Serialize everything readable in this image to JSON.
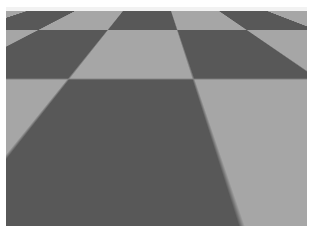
{
  "image": {
    "title": "Reflective sphere on checkerboard plane",
    "kind": "3d-render",
    "width_px": 313,
    "height_px": 233,
    "border": {
      "name": "white-paper-margin",
      "color": "#ffffff",
      "top_px": 7,
      "left_px": 6,
      "right_px": 6,
      "bottom_px": 7
    }
  },
  "scene": {
    "description": "A raytraced grey metallic sphere resting on an infinite black-and-white checkerboard floor, lit by a single bright light producing a sharp specular highlight and a dark elliptical cast shadow to the right.",
    "horizon": {
      "name": "horizon-line",
      "y_px": 11,
      "sky_color": "#f2f2f2"
    },
    "ground": {
      "name": "checkerboard-ground-plane",
      "light_square_color": "#a6a6a6",
      "dark_square_color": "#585858",
      "pattern": "checkerboard",
      "projection": "perspective"
    },
    "sphere": {
      "name": "reflective-sphere",
      "material": "polished pitted metal",
      "base_color": "#757575",
      "center_x_px": 147,
      "center_y_px": 103,
      "radius_x_px": 66,
      "radius_y_px": 76,
      "specular_highlight": {
        "name": "specular-highlight",
        "color": "#ffffff",
        "x_px": 134,
        "y_px": 93
      },
      "surface_defects": {
        "name": "pitted-spots",
        "color": "#1a1a1a",
        "count": 8
      },
      "reflected_horizon_band": {
        "name": "reflected-horizon-band",
        "color": "#f0f0f0"
      },
      "reflected_floor": {
        "name": "reflected-checkerboard",
        "color": "#1e1e1e"
      }
    },
    "cast_shadow": {
      "name": "cast-shadow",
      "color": "#0e0e0e",
      "shape": "ellipse",
      "center_x_px": 194,
      "center_y_px": 149,
      "width_px": 152,
      "height_px": 78,
      "direction": "right"
    }
  }
}
